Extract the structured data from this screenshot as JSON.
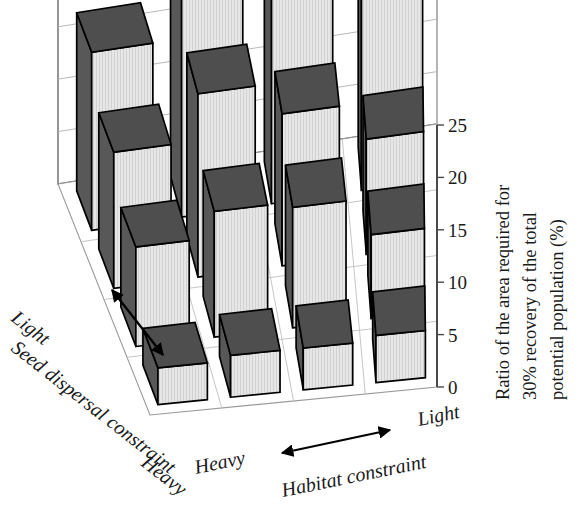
{
  "chart_data": {
    "type": "bar",
    "subtype": "3d-bar",
    "title": "",
    "ylabel_lines": [
      "Ratio of the area required for",
      "30% recovery of the total",
      "potential population (%)"
    ],
    "ylabel": "Ratio of the area required for 30% recovery of the total potential population (%)",
    "ylim": [
      0,
      25
    ],
    "yticks": [
      0,
      5,
      10,
      15,
      20,
      25
    ],
    "ytick_labels": [
      "0",
      "5",
      "10",
      "15",
      "20",
      "25"
    ],
    "grid": true,
    "legend": "none",
    "xlabel": "Habitat constraint",
    "x_axis": {
      "title": "Habitat constraint",
      "low_label": "Heavy",
      "high_label": "Light",
      "arrow": "double",
      "categories": [
        "Heavy",
        "",
        "",
        "Light"
      ]
    },
    "zlabel": "Seed dispersal constraint",
    "z_axis": {
      "title": "Seed dispersal constraint",
      "low_label": "Heavy",
      "high_label": "Light",
      "arrow": "double",
      "categories": [
        "Light",
        "",
        "",
        "Heavy"
      ]
    },
    "row_order": "back-to-front: Light -> Heavy seed dispersal constraint",
    "col_order": "left-to-right: Heavy -> Light habitat constraint",
    "series": [
      {
        "name": "Seed dispersal: Light (row 1, back)",
        "values": [
          17.0,
          21.5,
          26.0,
          19.5
        ]
      },
      {
        "name": "Seed dispersal: row 2",
        "values": [
          13.0,
          17.5,
          14.5,
          11.0
        ]
      },
      {
        "name": "Seed dispersal: row 3",
        "values": [
          9.5,
          12.0,
          11.5,
          8.0
        ]
      },
      {
        "name": "Seed dispersal: Heavy (row 4, front)",
        "values": [
          3.5,
          4.0,
          4.0,
          4.5
        ]
      }
    ],
    "values_grid": [
      [
        17.0,
        21.5,
        26.0,
        19.5
      ],
      [
        13.0,
        17.5,
        14.5,
        11.0
      ],
      [
        9.5,
        12.0,
        11.5,
        8.0
      ],
      [
        3.5,
        4.0,
        4.0,
        4.5
      ]
    ],
    "bar_colors": {
      "front": "#e3e3e3",
      "side": "#585858",
      "top": "#4e4e4e",
      "edge": "#000000"
    }
  }
}
